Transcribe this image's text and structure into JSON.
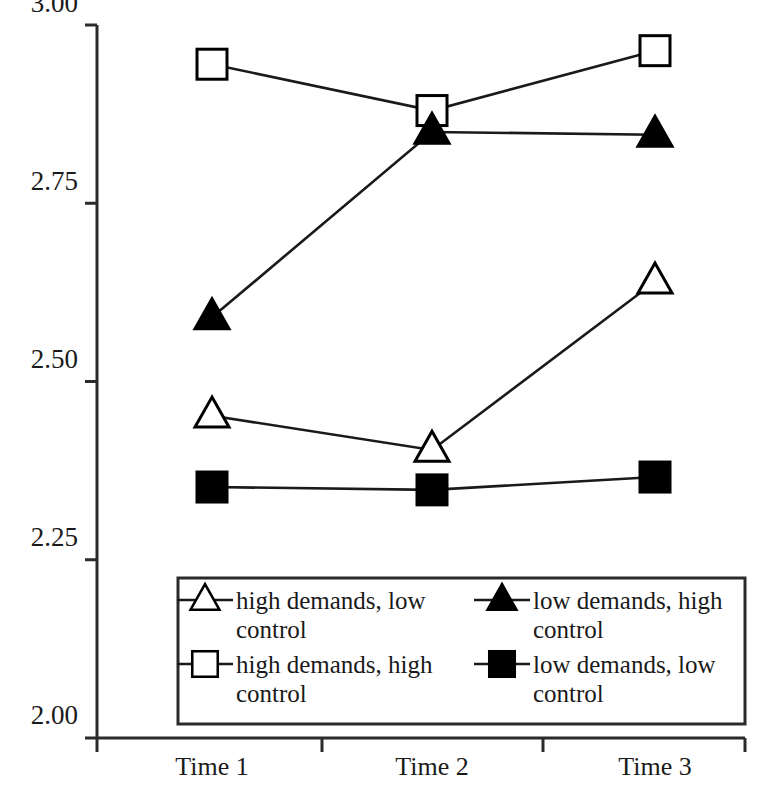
{
  "chart_data": {
    "type": "line",
    "title": "",
    "subtitle": "",
    "xlabel": "",
    "ylabel": "",
    "categories": [
      "Time 1",
      "Time 2",
      "Time 3"
    ],
    "ylim": [
      2.0,
      3.0
    ],
    "yticks": [
      "2.00",
      "2.25",
      "2.50",
      "2.75",
      "3.00"
    ],
    "ytick_values": [
      2.0,
      2.25,
      2.5,
      2.75,
      3.0
    ],
    "grid": false,
    "legend_position": "inside-bottom-center",
    "legend_columns": 2,
    "series": [
      {
        "name": "high demands, low control",
        "marker": "open-triangle",
        "marker_fill": "#ffffff",
        "marker_stroke": "#000000",
        "values": [
          2.452,
          2.404,
          2.64
        ]
      },
      {
        "name": "high demands, high control",
        "marker": "open-square",
        "marker_fill": "#ffffff",
        "marker_stroke": "#000000",
        "values": [
          2.945,
          2.88,
          2.964
        ]
      },
      {
        "name": "low demands, high control",
        "marker": "filled-triangle",
        "marker_fill": "#000000",
        "marker_stroke": "#000000",
        "values": [
          2.59,
          2.85,
          2.846
        ]
      },
      {
        "name": "low demands, low control",
        "marker": "filled-square",
        "marker_fill": "#000000",
        "marker_stroke": "#000000",
        "values": [
          2.352,
          2.348,
          2.366
        ]
      }
    ]
  },
  "axes": {
    "y_tick_0": "2.00",
    "y_tick_1": "2.25",
    "y_tick_2": "2.50",
    "y_tick_3": "2.75",
    "y_tick_4": "3.00",
    "x_cat_0": "Time 1",
    "x_cat_1": "Time 2",
    "x_cat_2": "Time 3"
  },
  "legend": {
    "entry_0_line_1": "high demands, low",
    "entry_0_line_2": "control",
    "entry_1_line_1": "high demands, high",
    "entry_1_line_2": "control",
    "entry_2_line_1": "low demands, high",
    "entry_2_line_2": "control",
    "entry_3_line_1": "low demands, low",
    "entry_3_line_2": "control"
  },
  "colors": {
    "axis": "#2b2b2b",
    "series_line": "#1a1a1a",
    "marker_fill_open": "#ffffff",
    "marker_fill_closed": "#000000",
    "background": "#ffffff"
  }
}
